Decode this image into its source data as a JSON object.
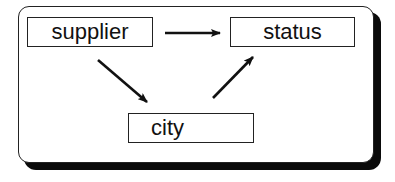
{
  "diagram": {
    "type": "functional-dependency",
    "nodes": [
      {
        "id": "supplier",
        "label": "supplier"
      },
      {
        "id": "status",
        "label": "status"
      },
      {
        "id": "city",
        "label": "city"
      }
    ],
    "edges": [
      {
        "from": "supplier",
        "to": "status"
      },
      {
        "from": "supplier",
        "to": "city"
      },
      {
        "from": "city",
        "to": "status"
      }
    ],
    "colors": {
      "stroke": "#111111",
      "shadow": "#0a0a0a",
      "background": "#ffffff"
    }
  }
}
